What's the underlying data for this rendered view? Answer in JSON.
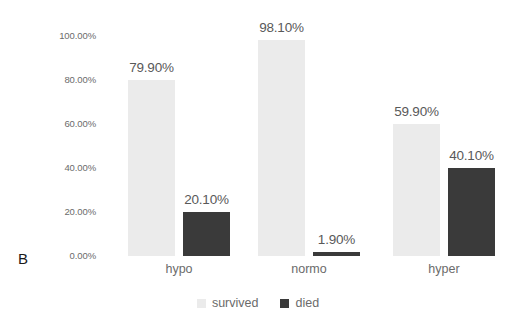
{
  "panel": {
    "label": "B"
  },
  "axis": {
    "y_ticks": [
      "100.00%",
      "80.00%",
      "60.00%",
      "40.00%",
      "20.00%",
      "0.00%"
    ]
  },
  "legend": {
    "items": [
      {
        "label": "survived",
        "color": "#ebebeb"
      },
      {
        "label": "died",
        "color": "#3a3a3a"
      }
    ]
  },
  "groups": [
    {
      "name": "hypo",
      "survived_label": "79.90%",
      "died_label": "20.10%"
    },
    {
      "name": "normo",
      "survived_label": "98.10%",
      "died_label": "1.90%"
    },
    {
      "name": "hyper",
      "survived_label": "59.90%",
      "died_label": "40.10%"
    }
  ],
  "chart_data": {
    "type": "bar",
    "title": "",
    "subtitle": "",
    "panel_label": "B",
    "xlabel": "",
    "ylabel": "",
    "categories": [
      "hypo",
      "normo",
      "hyper"
    ],
    "series": [
      {
        "name": "survived",
        "values": [
          79.9,
          98.1,
          59.9
        ],
        "color": "#ebebeb"
      },
      {
        "name": "died",
        "values": [
          20.1,
          1.9,
          40.1
        ],
        "color": "#3a3a3a"
      }
    ],
    "data_labels": [
      [
        "79.90%",
        "98.10%",
        "59.90%"
      ],
      [
        "20.10%",
        "1.90%",
        "40.10%"
      ]
    ],
    "ylim": [
      0,
      100
    ],
    "ytick_values": [
      0,
      20,
      40,
      60,
      80,
      100
    ],
    "ytick_labels": [
      "0.00%",
      "20.00%",
      "40.00%",
      "60.00%",
      "80.00%",
      "100.00%"
    ],
    "yaxis_format": "percent",
    "grid": false,
    "legend_position": "bottom",
    "units": "percent"
  }
}
